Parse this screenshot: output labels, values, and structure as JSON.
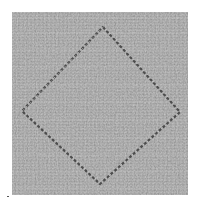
{
  "image": {
    "description": "Grayscale photograph of woven fabric with a stitched diamond outline",
    "subject": "stitched diamond on woven textile",
    "colors": {
      "background": "#ffffff",
      "fabric_base": "#8c8c8c",
      "fabric_light": "#b4b4b4",
      "fabric_dark": "#6a6a6a",
      "stitch_dark": "#3c3c3c",
      "stitch_light": "#d2d2d2"
    },
    "diamond": {
      "top": [
        103,
        27
      ],
      "right": [
        180,
        112
      ],
      "bottom": [
        100,
        184
      ],
      "left": [
        22,
        111
      ]
    }
  }
}
